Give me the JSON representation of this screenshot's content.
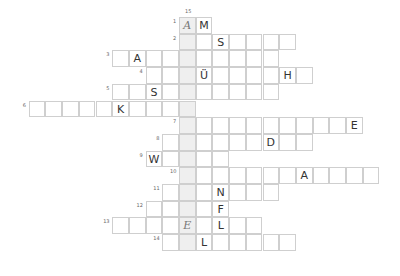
{
  "puzzle": {
    "type": "crossword",
    "solution_column_number": "15",
    "solution_column_letters": [
      "A",
      "",
      "",
      "",
      "",
      "",
      "",
      "",
      "",
      "",
      "",
      "",
      "E",
      ""
    ],
    "rows": [
      {
        "number": "1",
        "start": 0,
        "length": 2,
        "letters": {
          "0": "A",
          "1": "M"
        }
      },
      {
        "number": "2",
        "start": 0,
        "length": 7,
        "letters": {
          "2": "S"
        }
      },
      {
        "number": "3",
        "start": -4,
        "length": 10,
        "letters": {
          "-3": "A"
        }
      },
      {
        "number": "4",
        "start": -2,
        "length": 10,
        "letters": {
          "1": "Ü",
          "6": "H"
        }
      },
      {
        "number": "5",
        "start": -4,
        "length": 10,
        "letters": {
          "-2": "S"
        }
      },
      {
        "number": "6",
        "start": -9,
        "length": 10,
        "letters": {
          "-4": "K"
        }
      },
      {
        "number": "7",
        "start": 0,
        "length": 11,
        "letters": {
          "10": "E"
        }
      },
      {
        "number": "8",
        "start": -1,
        "length": 9,
        "letters": {
          "5": "D"
        }
      },
      {
        "number": "9",
        "start": -2,
        "length": 5,
        "letters": {
          "-2": "W"
        }
      },
      {
        "number": "10",
        "start": 0,
        "length": 12,
        "letters": {
          "7": "A"
        }
      },
      {
        "number": "11",
        "start": -1,
        "length": 7,
        "letters": {
          "2": "N"
        }
      },
      {
        "number": "12",
        "start": -2,
        "length": 5,
        "letters": {
          "2": "F"
        }
      },
      {
        "number": "13",
        "start": -4,
        "length": 9,
        "letters": {
          "0": "E",
          "2": "L"
        }
      },
      {
        "number": "14",
        "start": -1,
        "length": 8,
        "letters": {
          "1": "L"
        }
      }
    ],
    "handwritten": {
      "1": "0",
      "13": "0"
    }
  }
}
